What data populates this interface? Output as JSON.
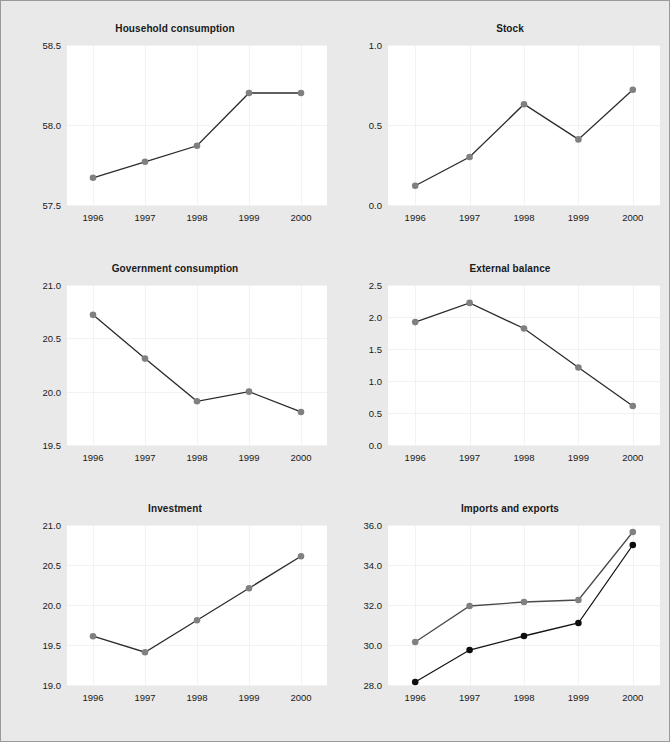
{
  "figure": {
    "width": 670,
    "height": 742,
    "background_color": "#e9e9e9",
    "panel_background_color": "#ffffff",
    "border_color": "#9a9a9a",
    "gridline_color": "#f2f2f2",
    "marker_gray": "#808080",
    "marker_black": "#0d0d0d",
    "line_dark": "#2b2b2b"
  },
  "chart_data": [
    {
      "type": "line",
      "title": "Household consumption",
      "xlabel": "",
      "ylabel": "",
      "categories": [
        "1996",
        "1997",
        "1998",
        "1999",
        "2000"
      ],
      "values": [
        57.67,
        57.77,
        57.87,
        58.2,
        58.2
      ],
      "yticks": [
        "57.5",
        "58.0",
        "58.5"
      ],
      "ytick_values": [
        57.5,
        58.0,
        58.5
      ],
      "ylim": [
        57.5,
        58.5
      ],
      "grid": true,
      "legend": "none",
      "marker_color": "#808080",
      "line_color": "#2b2b2b"
    },
    {
      "type": "line",
      "title": "Stock",
      "xlabel": "",
      "ylabel": "",
      "categories": [
        "1996",
        "1997",
        "1998",
        "1999",
        "2000"
      ],
      "values": [
        0.12,
        0.3,
        0.63,
        0.41,
        0.72
      ],
      "yticks": [
        "0.0",
        "0.5",
        "1.0"
      ],
      "ytick_values": [
        0.0,
        0.5,
        1.0
      ],
      "ylim": [
        0.0,
        1.0
      ],
      "grid": true,
      "legend": "none",
      "marker_color": "#808080",
      "line_color": "#2b2b2b"
    },
    {
      "type": "line",
      "title": "Government consumption",
      "xlabel": "",
      "ylabel": "",
      "categories": [
        "1996",
        "1997",
        "1998",
        "1999",
        "2000"
      ],
      "values": [
        20.72,
        20.31,
        19.91,
        20.0,
        19.81
      ],
      "yticks": [
        "19.5",
        "20.0",
        "20.5",
        "21.0"
      ],
      "ytick_values": [
        19.5,
        20.0,
        20.5,
        21.0
      ],
      "ylim": [
        19.5,
        21.0
      ],
      "grid": true,
      "legend": "none",
      "marker_color": "#808080",
      "line_color": "#2b2b2b"
    },
    {
      "type": "line",
      "title": "External balance",
      "xlabel": "",
      "ylabel": "",
      "categories": [
        "1996",
        "1997",
        "1998",
        "1999",
        "2000"
      ],
      "values": [
        1.92,
        2.22,
        1.82,
        1.21,
        0.61
      ],
      "yticks": [
        "0.0",
        "0.5",
        "1.0",
        "1.5",
        "2.0",
        "2.5"
      ],
      "ytick_values": [
        0.0,
        0.5,
        1.0,
        1.5,
        2.0,
        2.5
      ],
      "ylim": [
        0.0,
        2.5
      ],
      "grid": true,
      "legend": "none",
      "marker_color": "#808080",
      "line_color": "#2b2b2b"
    },
    {
      "type": "line",
      "title": "Investment",
      "xlabel": "",
      "ylabel": "",
      "categories": [
        "1996",
        "1997",
        "1998",
        "1999",
        "2000"
      ],
      "values": [
        19.61,
        19.41,
        19.81,
        20.21,
        20.61
      ],
      "yticks": [
        "19.0",
        "19.5",
        "20.0",
        "20.5",
        "21.0"
      ],
      "ytick_values": [
        19.0,
        19.5,
        20.0,
        20.5,
        21.0
      ],
      "ylim": [
        19.0,
        21.0
      ],
      "grid": true,
      "legend": "none",
      "marker_color": "#808080",
      "line_color": "#2b2b2b"
    },
    {
      "type": "line",
      "title": "Imports and exports",
      "xlabel": "",
      "ylabel": "",
      "categories": [
        "1996",
        "1997",
        "1998",
        "1999",
        "2000"
      ],
      "series": [
        {
          "name": "Imports",
          "values": [
            30.15,
            31.95,
            32.15,
            32.25,
            35.65
          ],
          "marker_color": "#808080",
          "line_color": "#4a4a4a"
        },
        {
          "name": "Exports",
          "values": [
            28.15,
            29.75,
            30.45,
            31.1,
            35.0
          ],
          "marker_color": "#0d0d0d",
          "line_color": "#141414"
        }
      ],
      "yticks": [
        "28.0",
        "30.0",
        "32.0",
        "34.0",
        "36.0"
      ],
      "ytick_values": [
        28.0,
        30.0,
        32.0,
        34.0,
        36.0
      ],
      "ylim": [
        28.0,
        36.0
      ],
      "grid": true,
      "legend": "none"
    }
  ],
  "layout": {
    "panels": [
      {
        "left": 14,
        "top": 22,
        "width": 320,
        "height": 218,
        "plot_left": 52,
        "plot_top": 22,
        "plot_width": 260,
        "plot_height": 160
      },
      {
        "left": 349,
        "top": 22,
        "width": 320,
        "height": 218,
        "plot_left": 38,
        "plot_top": 22,
        "plot_width": 272,
        "plot_height": 160
      },
      {
        "left": 14,
        "top": 262,
        "width": 320,
        "height": 218,
        "plot_left": 52,
        "plot_top": 22,
        "plot_width": 260,
        "plot_height": 160
      },
      {
        "left": 349,
        "top": 262,
        "width": 320,
        "height": 218,
        "plot_left": 38,
        "plot_top": 22,
        "plot_width": 272,
        "plot_height": 160
      },
      {
        "left": 14,
        "top": 502,
        "width": 320,
        "height": 218,
        "plot_left": 52,
        "plot_top": 22,
        "plot_width": 260,
        "plot_height": 160
      },
      {
        "left": 349,
        "top": 502,
        "width": 320,
        "height": 218,
        "plot_left": 38,
        "plot_top": 22,
        "plot_width": 272,
        "plot_height": 160
      }
    ]
  }
}
